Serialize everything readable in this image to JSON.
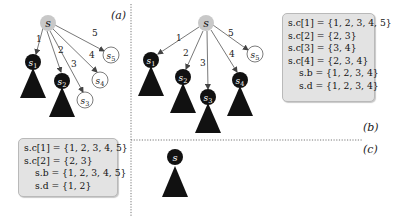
{
  "panels": {
    "a": {
      "label": "(a)",
      "root": "s",
      "children": [
        {
          "name": "s1",
          "edge": "1",
          "state": "expanded"
        },
        {
          "name": "s2",
          "edge": "2",
          "state": "expanded"
        },
        {
          "name": "s3",
          "edge": "3",
          "state": "open"
        },
        {
          "name": "s4",
          "edge": "4",
          "state": "open"
        },
        {
          "name": "s5",
          "edge": "5",
          "state": "open"
        }
      ],
      "box": [
        "s.c[1] = {1, 2, 3, 4, 5}",
        "s.c[2] = {2, 3}",
        "s.b = {1, 2, 3, 4, 5}",
        "s.d = {1, 2}"
      ]
    },
    "b": {
      "label": "(b)",
      "root": "s",
      "children": [
        {
          "name": "s1",
          "edge": "1",
          "state": "expanded"
        },
        {
          "name": "s2",
          "edge": "2",
          "state": "expanded"
        },
        {
          "name": "s3",
          "edge": "3",
          "state": "expanded"
        },
        {
          "name": "s4",
          "edge": "4",
          "state": "expanded"
        },
        {
          "name": "s5",
          "edge": "5",
          "state": "open"
        }
      ],
      "box": [
        "s.c[1] = {1, 2, 3, 4, 5}",
        "s.c[2] = {2, 3}",
        "s.c[3] = {3, 4}",
        "s.c[4] = {2, 3, 4}",
        "s.b = {1, 2, 3, 4}",
        "s.d = {1, 2, 3, 4}"
      ]
    },
    "c": {
      "label": "(c)",
      "root": "s"
    }
  },
  "colors": {
    "root_fill": "#c8c8c8",
    "expanded_fill": "#111111",
    "open_fill": "#ffffff",
    "edge": "#555555",
    "box_fill": "#e3e3e3"
  }
}
